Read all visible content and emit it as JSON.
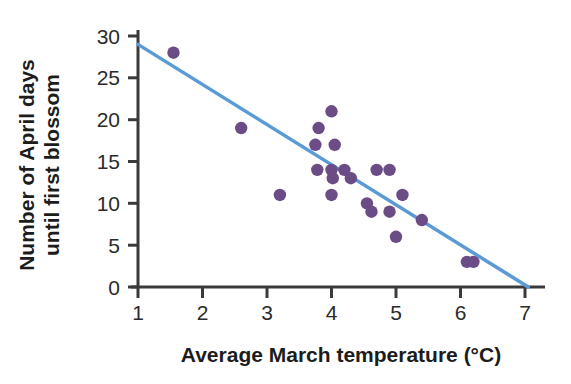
{
  "chart_data": {
    "type": "scatter",
    "title": "",
    "subtitle": "",
    "xlabel": "Average March temperature (°C)",
    "ylabel_line1": "Number of April days",
    "ylabel_line2": "until first blossom",
    "ylabel": "Number of April days until first blossom",
    "xlim": [
      1,
      7
    ],
    "ylim": [
      0,
      31
    ],
    "xticks": [
      1,
      2,
      3,
      4,
      5,
      6,
      7
    ],
    "xtick_labels": [
      "1",
      "2",
      "3",
      "4",
      "5",
      "6",
      "7"
    ],
    "yticks": [
      0,
      5,
      10,
      15,
      20,
      25,
      30
    ],
    "ytick_labels": [
      "0",
      "5",
      "10",
      "15",
      "20",
      "25",
      "30"
    ],
    "grid": false,
    "legend": false,
    "legend_position": "none",
    "marker_color": "#6b4c86",
    "line_color": "#5b9bd5",
    "axis_color": "#3a3a3a",
    "series": [
      {
        "name": "Blossom observations",
        "type": "scatter",
        "marker_color": "#6b4c86",
        "points": [
          {
            "x": 1.55,
            "y": 28
          },
          {
            "x": 2.6,
            "y": 19
          },
          {
            "x": 3.2,
            "y": 11
          },
          {
            "x": 3.75,
            "y": 17
          },
          {
            "x": 3.8,
            "y": 19
          },
          {
            "x": 3.78,
            "y": 14
          },
          {
            "x": 4.0,
            "y": 21
          },
          {
            "x": 4.05,
            "y": 17
          },
          {
            "x": 4.0,
            "y": 14
          },
          {
            "x": 4.02,
            "y": 13
          },
          {
            "x": 4.0,
            "y": 11
          },
          {
            "x": 4.2,
            "y": 14
          },
          {
            "x": 4.3,
            "y": 13
          },
          {
            "x": 4.55,
            "y": 10
          },
          {
            "x": 4.62,
            "y": 9
          },
          {
            "x": 4.7,
            "y": 14
          },
          {
            "x": 4.9,
            "y": 14
          },
          {
            "x": 4.9,
            "y": 9
          },
          {
            "x": 5.0,
            "y": 6
          },
          {
            "x": 5.1,
            "y": 11
          },
          {
            "x": 5.4,
            "y": 8
          },
          {
            "x": 6.1,
            "y": 3
          },
          {
            "x": 6.2,
            "y": 3
          }
        ]
      },
      {
        "name": "Regression line",
        "type": "line",
        "line_color": "#5b9bd5",
        "endpoints": [
          {
            "x": 1,
            "y": 29
          },
          {
            "x": 7.05,
            "y": 0
          }
        ]
      }
    ]
  }
}
